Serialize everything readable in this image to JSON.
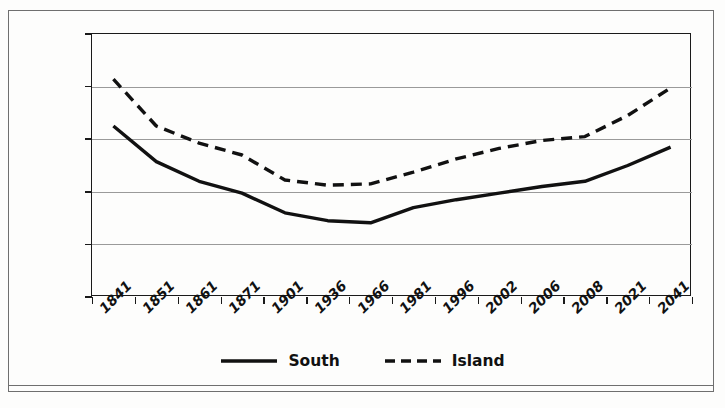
{
  "chart_data": {
    "type": "line",
    "title": "",
    "subtitle": "",
    "xlabel": "",
    "ylabel": "",
    "ylim": [
      0,
      10000
    ],
    "yticks": [
      0,
      2000,
      4000,
      6000,
      8000,
      10000
    ],
    "ytick_labels": [
      "0",
      "2000",
      "4000",
      "6000",
      "8000",
      "10000"
    ],
    "grid": true,
    "legend_position": "bottom-center",
    "categories": [
      "1841",
      "1851",
      "1861",
      "1871",
      "1901",
      "1936",
      "1966",
      "1981",
      "1996",
      "2002",
      "2006",
      "2008",
      "2021",
      "2041"
    ],
    "series": [
      {
        "name": "South",
        "style": "solid",
        "color": "#111111",
        "values": [
          6500,
          5150,
          4400,
          3950,
          3200,
          2900,
          2820,
          3400,
          3700,
          3950,
          4200,
          4400,
          5000,
          5700
        ]
      },
      {
        "name": "Island",
        "style": "dashed",
        "color": "#111111",
        "values": [
          8280,
          6500,
          5850,
          5400,
          4450,
          4250,
          4300,
          4750,
          5250,
          5650,
          5950,
          6100,
          6900,
          7950
        ]
      }
    ]
  },
  "axis": {
    "y_tick_labels": [
      "10 000",
      "8000",
      "6000",
      "4000",
      "2000",
      "0"
    ],
    "y_tick_values": [
      10000,
      8000,
      6000,
      4000,
      2000,
      0
    ]
  },
  "legend": {
    "items": [
      {
        "label": "South",
        "style": "solid"
      },
      {
        "label": "Island",
        "style": "dashed"
      }
    ]
  }
}
